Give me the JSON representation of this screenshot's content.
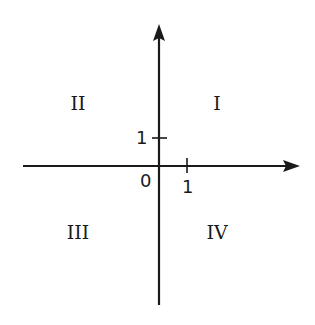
{
  "diagram": {
    "type": "cartesian-coordinate-plane",
    "stroke_color": "#1a1a1a",
    "background": "#ffffff",
    "origin_label": "0",
    "x_axis": {
      "tick_label": "1",
      "direction": "right-arrow"
    },
    "y_axis": {
      "tick_label": "1",
      "direction": "up-arrow"
    },
    "quadrants": {
      "q1": "I",
      "q2": "II",
      "q3": "III",
      "q4": "IV"
    }
  }
}
